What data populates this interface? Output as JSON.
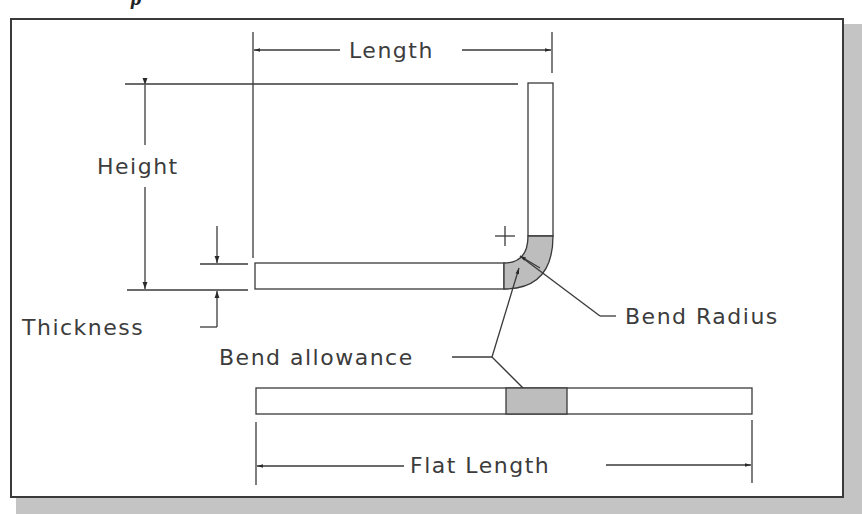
{
  "caption_fragment": "p",
  "labels": {
    "length": "Length",
    "height": "Height",
    "thickness": "Thickness",
    "bend_radius": "Bend Radius",
    "bend_allowance": "Bend allowance",
    "flat_length": "Flat Length"
  },
  "colors": {
    "line": "#3a3a3a",
    "fill_bend": "#bdbdbd",
    "shadow": "#c4c4c4",
    "text": "#3c3c3c"
  }
}
